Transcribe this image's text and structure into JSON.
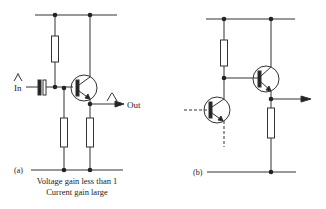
{
  "figure": {
    "panel_a": {
      "label": "(a)",
      "input_label": "In",
      "output_label": "Out",
      "caption_line1": "Voltage gain less than 1",
      "caption_line2": "Current gain large"
    },
    "panel_b": {
      "label": "(b)"
    },
    "colors": {
      "line": "#333333",
      "background": "#ffffff"
    }
  }
}
